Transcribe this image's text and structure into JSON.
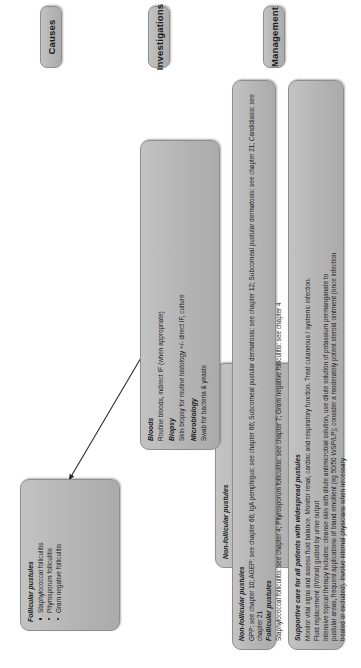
{
  "title": "Widespread Pustules in adults",
  "stages": [
    {
      "key": "causes",
      "label": "Causes"
    },
    {
      "key": "investigations",
      "label": "Investigations"
    },
    {
      "key": "management",
      "label": "Management"
    }
  ],
  "causes": {
    "follicular": {
      "heading": "Follicular pustules",
      "items": [
        "Staphylococcal folliculitis",
        "Pityrosporum folliculitis",
        "Gram negative folliculitis"
      ]
    },
    "non_follicular": {
      "heading": "Non-follicular pustules",
      "items": [
        "Generalised pustular psoriasis",
        "Acute generalised exanthematous pustulosis",
        "IgA pemphigus",
        "Subcorneal pustular dermatosis",
        "Candidiasis / aspergillosis (in immunocompromised patients)"
      ]
    }
  },
  "investigations": {
    "groups": [
      {
        "heading": "Bloods",
        "lines": [
          "Routine bloods, indirect IF (when appropriate)"
        ]
      },
      {
        "heading": "Biopsy",
        "lines": [
          "Skin biopsy for routine histology +/- direct IF, culture"
        ]
      },
      {
        "heading": "Microbiology",
        "lines": [
          "Swab for bacteria & yeasts"
        ]
      }
    ]
  },
  "management": {
    "chapters": {
      "non_follicular_heading": "Non-follicular pustules",
      "non_follicular_line": "GPP: see chapter 10; AGEP: see chapter 66; IgA pemphigus: see chapter 66; Subcorneal pustular dermatosis: see chapter 12; Subcorneal pustular dermatosis: see chapter 21; Candidiasis: see chapter 21",
      "follicular_heading": "Follicular pustules",
      "follicular_line": "Staphylococcal folliculitis: see chapter 4; Pityrosporum folliculitis: see chapter 7; Gram negative folliculitis: see chapter 4"
    },
    "supportive": {
      "heading": "Supportive care for all patients with widespread pustules",
      "lines": [
        "Monitor vital signs and assess fluid balance. Monitor renal, cardiac and respiratory function. Treat cutaneous / systemic infection.",
        "Fluid replacement (IV/oral) guided by urine output",
        "Intensive topical therapy includes: cleanse skin with dilute antimicrobial solution, use dilute solution of potassium permanganate to",
        "pustular areas, frequent applications of bland emollient (eg 50/50 WSP/LP); consider a moderately potent steroid ointment (once infection",
        "treated or excluded). Involve internal physicians when necessary"
      ]
    }
  }
}
